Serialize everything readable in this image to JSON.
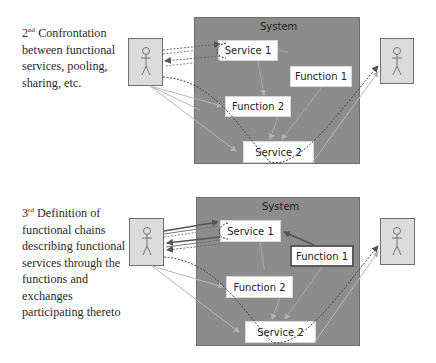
{
  "diagram_top": {
    "caption": {
      "ordinal": "2",
      "ordinal_suffix": "nd",
      "lines": [
        "Confrontation",
        "between functional",
        "services, pooling,",
        "sharing, etc."
      ]
    },
    "system_label": "System",
    "nodes": {
      "service1": "Service 1",
      "function1": "Function 1",
      "function2": "Function 2",
      "service2": "Service 2"
    }
  },
  "diagram_bottom": {
    "caption": {
      "ordinal": "3",
      "ordinal_suffix": "rd",
      "lines": [
        "Definition of",
        "functional chains",
        "describing functional",
        "services through the",
        "functions and",
        "exchanges",
        "participating thereto"
      ]
    },
    "system_label": "System",
    "nodes": {
      "service1": "Service 1",
      "function1": "Function 1",
      "function2": "Function 2",
      "service2": "Service 2"
    }
  },
  "colors": {
    "system_fill": "#8c8c8c",
    "actor_fill": "#dcdcdc",
    "node_fill": "#ffffff",
    "solid_link": "#c0c0c0",
    "dark_link": "#5a5a5a",
    "dotted_link": "#555555"
  }
}
